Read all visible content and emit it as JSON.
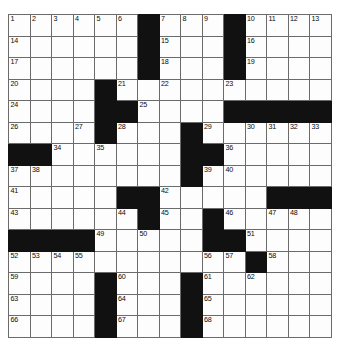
{
  "puzzle": {
    "type": "crossword-grid",
    "rows": 15,
    "columns": 15,
    "cell_size_px": 21.5,
    "colors": {
      "block": "#111111",
      "cell": "#fdfdfd",
      "grid_line": "#6b6b6b",
      "border": "#3a3a3a",
      "number_text": "#0a0a0a"
    },
    "max_clue_number": 68,
    "grid": [
      [
        {
          "block": false,
          "num": "1"
        },
        {
          "block": false,
          "num": "2"
        },
        {
          "block": false,
          "num": "3"
        },
        {
          "block": false,
          "num": "4"
        },
        {
          "block": false,
          "num": "5"
        },
        {
          "block": false,
          "num": "6"
        },
        {
          "block": true,
          "num": ""
        },
        {
          "block": false,
          "num": "7"
        },
        {
          "block": false,
          "num": "8"
        },
        {
          "block": false,
          "num": "9"
        },
        {
          "block": true,
          "num": ""
        },
        {
          "block": false,
          "num": "10"
        },
        {
          "block": false,
          "num": "11"
        },
        {
          "block": false,
          "num": "12"
        },
        {
          "block": false,
          "num": "13"
        }
      ],
      [
        {
          "block": false,
          "num": "14"
        },
        {
          "block": false,
          "num": ""
        },
        {
          "block": false,
          "num": ""
        },
        {
          "block": false,
          "num": ""
        },
        {
          "block": false,
          "num": ""
        },
        {
          "block": false,
          "num": ""
        },
        {
          "block": true,
          "num": ""
        },
        {
          "block": false,
          "num": "15"
        },
        {
          "block": false,
          "num": ""
        },
        {
          "block": false,
          "num": ""
        },
        {
          "block": true,
          "num": ""
        },
        {
          "block": false,
          "num": "16"
        },
        {
          "block": false,
          "num": ""
        },
        {
          "block": false,
          "num": ""
        },
        {
          "block": false,
          "num": ""
        }
      ],
      [
        {
          "block": false,
          "num": "17"
        },
        {
          "block": false,
          "num": ""
        },
        {
          "block": false,
          "num": ""
        },
        {
          "block": false,
          "num": ""
        },
        {
          "block": false,
          "num": ""
        },
        {
          "block": false,
          "num": ""
        },
        {
          "block": true,
          "num": ""
        },
        {
          "block": false,
          "num": "18"
        },
        {
          "block": false,
          "num": ""
        },
        {
          "block": false,
          "num": ""
        },
        {
          "block": true,
          "num": ""
        },
        {
          "block": false,
          "num": "19"
        },
        {
          "block": false,
          "num": ""
        },
        {
          "block": false,
          "num": ""
        },
        {
          "block": false,
          "num": ""
        }
      ],
      [
        {
          "block": false,
          "num": "20"
        },
        {
          "block": false,
          "num": ""
        },
        {
          "block": false,
          "num": ""
        },
        {
          "block": false,
          "num": ""
        },
        {
          "block": true,
          "num": ""
        },
        {
          "block": false,
          "num": "21"
        },
        {
          "block": false,
          "num": ""
        },
        {
          "block": false,
          "num": "22"
        },
        {
          "block": false,
          "num": ""
        },
        {
          "block": false,
          "num": ""
        },
        {
          "block": false,
          "num": "23"
        },
        {
          "block": false,
          "num": ""
        },
        {
          "block": false,
          "num": ""
        },
        {
          "block": false,
          "num": ""
        },
        {
          "block": false,
          "num": ""
        }
      ],
      [
        {
          "block": false,
          "num": "24"
        },
        {
          "block": false,
          "num": ""
        },
        {
          "block": false,
          "num": ""
        },
        {
          "block": false,
          "num": ""
        },
        {
          "block": true,
          "num": ""
        },
        {
          "block": true,
          "num": ""
        },
        {
          "block": false,
          "num": "25"
        },
        {
          "block": false,
          "num": ""
        },
        {
          "block": false,
          "num": ""
        },
        {
          "block": false,
          "num": ""
        },
        {
          "block": true,
          "num": ""
        },
        {
          "block": true,
          "num": ""
        },
        {
          "block": true,
          "num": ""
        },
        {
          "block": true,
          "num": ""
        },
        {
          "block": true,
          "num": ""
        }
      ],
      [
        {
          "block": false,
          "num": "26"
        },
        {
          "block": false,
          "num": ""
        },
        {
          "block": false,
          "num": ""
        },
        {
          "block": false,
          "num": "27"
        },
        {
          "block": true,
          "num": ""
        },
        {
          "block": false,
          "num": "28"
        },
        {
          "block": false,
          "num": ""
        },
        {
          "block": false,
          "num": ""
        },
        {
          "block": true,
          "num": ""
        },
        {
          "block": false,
          "num": "29"
        },
        {
          "block": false,
          "num": ""
        },
        {
          "block": false,
          "num": "30"
        },
        {
          "block": false,
          "num": "31"
        },
        {
          "block": false,
          "num": "32"
        },
        {
          "block": false,
          "num": "33"
        }
      ],
      [
        {
          "block": true,
          "num": ""
        },
        {
          "block": true,
          "num": ""
        },
        {
          "block": false,
          "num": "34"
        },
        {
          "block": false,
          "num": ""
        },
        {
          "block": false,
          "num": "35"
        },
        {
          "block": false,
          "num": ""
        },
        {
          "block": false,
          "num": ""
        },
        {
          "block": false,
          "num": ""
        },
        {
          "block": true,
          "num": ""
        },
        {
          "block": true,
          "num": ""
        },
        {
          "block": false,
          "num": "36"
        },
        {
          "block": false,
          "num": ""
        },
        {
          "block": false,
          "num": ""
        },
        {
          "block": false,
          "num": ""
        },
        {
          "block": false,
          "num": ""
        }
      ],
      [
        {
          "block": false,
          "num": "37"
        },
        {
          "block": false,
          "num": "38"
        },
        {
          "block": false,
          "num": ""
        },
        {
          "block": false,
          "num": ""
        },
        {
          "block": false,
          "num": ""
        },
        {
          "block": false,
          "num": ""
        },
        {
          "block": false,
          "num": ""
        },
        {
          "block": false,
          "num": ""
        },
        {
          "block": true,
          "num": ""
        },
        {
          "block": false,
          "num": "39"
        },
        {
          "block": false,
          "num": "40"
        },
        {
          "block": false,
          "num": ""
        },
        {
          "block": false,
          "num": ""
        },
        {
          "block": false,
          "num": ""
        },
        {
          "block": false,
          "num": ""
        }
      ],
      [
        {
          "block": false,
          "num": "41"
        },
        {
          "block": false,
          "num": ""
        },
        {
          "block": false,
          "num": ""
        },
        {
          "block": false,
          "num": ""
        },
        {
          "block": false,
          "num": ""
        },
        {
          "block": true,
          "num": ""
        },
        {
          "block": true,
          "num": ""
        },
        {
          "block": false,
          "num": "42"
        },
        {
          "block": false,
          "num": ""
        },
        {
          "block": false,
          "num": ""
        },
        {
          "block": false,
          "num": ""
        },
        {
          "block": false,
          "num": ""
        },
        {
          "block": true,
          "num": ""
        },
        {
          "block": true,
          "num": ""
        },
        {
          "block": true,
          "num": ""
        }
      ],
      [
        {
          "block": false,
          "num": "43"
        },
        {
          "block": false,
          "num": ""
        },
        {
          "block": false,
          "num": ""
        },
        {
          "block": false,
          "num": ""
        },
        {
          "block": false,
          "num": ""
        },
        {
          "block": false,
          "num": "44"
        },
        {
          "block": true,
          "num": ""
        },
        {
          "block": false,
          "num": "45"
        },
        {
          "block": false,
          "num": ""
        },
        {
          "block": true,
          "num": ""
        },
        {
          "block": false,
          "num": "46"
        },
        {
          "block": false,
          "num": ""
        },
        {
          "block": false,
          "num": "47"
        },
        {
          "block": false,
          "num": "48"
        },
        {
          "block": false,
          "num": ""
        }
      ],
      [
        {
          "block": true,
          "num": ""
        },
        {
          "block": true,
          "num": ""
        },
        {
          "block": true,
          "num": ""
        },
        {
          "block": true,
          "num": ""
        },
        {
          "block": false,
          "num": "49"
        },
        {
          "block": false,
          "num": ""
        },
        {
          "block": false,
          "num": "50"
        },
        {
          "block": false,
          "num": ""
        },
        {
          "block": false,
          "num": ""
        },
        {
          "block": true,
          "num": ""
        },
        {
          "block": true,
          "num": ""
        },
        {
          "block": false,
          "num": "51"
        },
        {
          "block": false,
          "num": ""
        },
        {
          "block": false,
          "num": ""
        },
        {
          "block": false,
          "num": ""
        }
      ],
      [
        {
          "block": false,
          "num": "52"
        },
        {
          "block": false,
          "num": "53"
        },
        {
          "block": false,
          "num": "54"
        },
        {
          "block": false,
          "num": "55"
        },
        {
          "block": false,
          "num": ""
        },
        {
          "block": false,
          "num": ""
        },
        {
          "block": false,
          "num": ""
        },
        {
          "block": false,
          "num": ""
        },
        {
          "block": false,
          "num": ""
        },
        {
          "block": false,
          "num": "56"
        },
        {
          "block": false,
          "num": "57"
        },
        {
          "block": true,
          "num": ""
        },
        {
          "block": false,
          "num": "58"
        },
        {
          "block": false,
          "num": ""
        },
        {
          "block": false,
          "num": ""
        }
      ],
      [
        {
          "block": false,
          "num": "59"
        },
        {
          "block": false,
          "num": ""
        },
        {
          "block": false,
          "num": ""
        },
        {
          "block": false,
          "num": ""
        },
        {
          "block": true,
          "num": ""
        },
        {
          "block": false,
          "num": "60"
        },
        {
          "block": false,
          "num": ""
        },
        {
          "block": false,
          "num": ""
        },
        {
          "block": true,
          "num": ""
        },
        {
          "block": false,
          "num": "61"
        },
        {
          "block": false,
          "num": ""
        },
        {
          "block": false,
          "num": "62"
        },
        {
          "block": false,
          "num": ""
        },
        {
          "block": false,
          "num": ""
        },
        {
          "block": false,
          "num": ""
        }
      ],
      [
        {
          "block": false,
          "num": "63"
        },
        {
          "block": false,
          "num": ""
        },
        {
          "block": false,
          "num": ""
        },
        {
          "block": false,
          "num": ""
        },
        {
          "block": true,
          "num": ""
        },
        {
          "block": false,
          "num": "64"
        },
        {
          "block": false,
          "num": ""
        },
        {
          "block": false,
          "num": ""
        },
        {
          "block": true,
          "num": ""
        },
        {
          "block": false,
          "num": "65"
        },
        {
          "block": false,
          "num": ""
        },
        {
          "block": false,
          "num": ""
        },
        {
          "block": false,
          "num": ""
        },
        {
          "block": false,
          "num": ""
        },
        {
          "block": false,
          "num": ""
        }
      ],
      [
        {
          "block": false,
          "num": "66"
        },
        {
          "block": false,
          "num": ""
        },
        {
          "block": false,
          "num": ""
        },
        {
          "block": false,
          "num": ""
        },
        {
          "block": true,
          "num": ""
        },
        {
          "block": false,
          "num": "67"
        },
        {
          "block": false,
          "num": ""
        },
        {
          "block": false,
          "num": ""
        },
        {
          "block": true,
          "num": ""
        },
        {
          "block": false,
          "num": "68"
        },
        {
          "block": false,
          "num": ""
        },
        {
          "block": false,
          "num": ""
        },
        {
          "block": false,
          "num": ""
        },
        {
          "block": false,
          "num": ""
        },
        {
          "block": false,
          "num": ""
        }
      ]
    ]
  }
}
